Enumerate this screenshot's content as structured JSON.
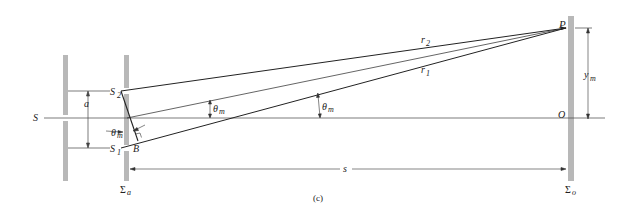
{
  "figure": {
    "caption": "(c)",
    "labels": {
      "source": "S",
      "slit_upper": "S",
      "slit_upper_sub": "2",
      "slit_lower": "S",
      "slit_lower_sub": "1",
      "slit_separation": "a",
      "foot_point": "B",
      "angle_slits": "θ",
      "angle_slits_sub": "m",
      "angle_mid": "θ",
      "angle_mid_sub": "m",
      "angle_right": "θ",
      "angle_right_sub": "m",
      "ray_upper": "r",
      "ray_upper_sub": "2",
      "ray_lower": "r",
      "ray_lower_sub": "1",
      "point_p": "P",
      "origin": "O",
      "height": "y",
      "height_sub": "m",
      "distance": "s",
      "aperture_plane": "Σ",
      "aperture_plane_sub": "a",
      "observation_plane": "Σ",
      "observation_plane_sub": "o"
    },
    "colors": {
      "barrier": "#b5b5b5",
      "line": "#333333"
    }
  }
}
